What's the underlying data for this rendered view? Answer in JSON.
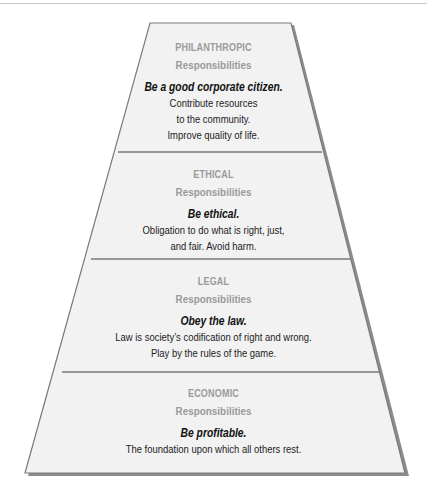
{
  "diagram": {
    "type": "pyramid",
    "colors": {
      "fill": "#f2f2f2",
      "outline": "#7a7a7a",
      "shadow": "#8c8c8c",
      "header_text": "#9a9a9a",
      "body_text": "#222222"
    },
    "tiers": [
      {
        "title": "PHILANTHROPIC",
        "subtitle": "Responsibilities",
        "motto": "Be a good corporate citizen.",
        "lines": [
          "Contribute resources",
          "to the community.",
          "Improve quality of life."
        ]
      },
      {
        "title": "ETHICAL",
        "subtitle": "Responsibilities",
        "motto": "Be ethical.",
        "lines": [
          "Obligation to do what is right, just,",
          "and fair.  Avoid harm."
        ]
      },
      {
        "title": "LEGAL",
        "subtitle": "Responsibilities",
        "motto": "Obey the law.",
        "lines": [
          "Law is society’s codification of right and wrong.",
          "Play by the rules of the game."
        ]
      },
      {
        "title": "ECONOMIC",
        "subtitle": "Responsibilities",
        "motto": "Be profitable.",
        "lines": [
          "The foundation upon which all others rest."
        ]
      }
    ]
  }
}
